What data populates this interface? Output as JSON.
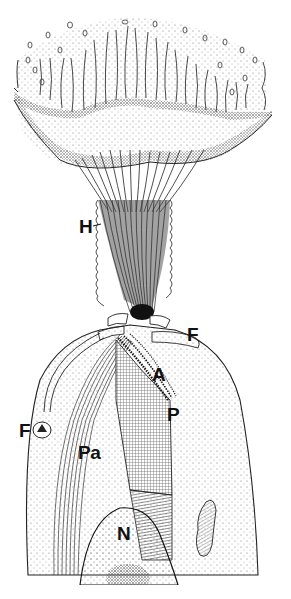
{
  "figure": {
    "type": "labeled scientific line illustration",
    "background": "#ffffff",
    "ink": "#111111"
  },
  "labels": [
    {
      "id": "H",
      "text": "H",
      "x": 79,
      "y": 217
    },
    {
      "id": "F-right",
      "text": "F",
      "x": 187,
      "y": 325
    },
    {
      "id": "A",
      "text": "A",
      "x": 152,
      "y": 365
    },
    {
      "id": "P",
      "text": "P",
      "x": 167,
      "y": 405
    },
    {
      "id": "F-left",
      "text": "F",
      "x": 19,
      "y": 421
    },
    {
      "id": "Pa",
      "text": "Pa",
      "x": 78,
      "y": 443
    },
    {
      "id": "N",
      "text": "N",
      "x": 117,
      "y": 524
    }
  ]
}
